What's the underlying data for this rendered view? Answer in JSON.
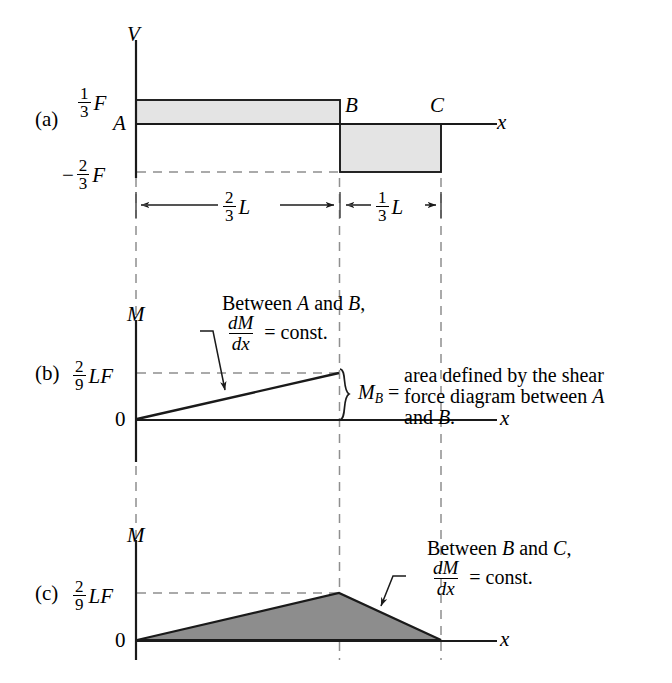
{
  "figure": {
    "colors": {
      "line": "#1a1a1a",
      "dashed": "#8a8a8a",
      "shear_fill_light": "#e2e2e2",
      "moment_fill_dark": "#8c8c8c",
      "background": "#ffffff"
    },
    "panels": [
      {
        "id": "a",
        "tag": "(a)",
        "axis_vertical": "V",
        "axis_horizontal": "x",
        "value_labels": [
          {
            "name": "positive-shear",
            "numerator": "1",
            "denominator": "3",
            "unit": "F",
            "sign": ""
          },
          {
            "name": "point-a",
            "text": "A"
          },
          {
            "name": "negative-shear",
            "numerator": "2",
            "denominator": "3",
            "unit": "F",
            "sign": "−"
          }
        ],
        "point_labels": [
          {
            "name": "point-b",
            "text": "B"
          },
          {
            "name": "point-c",
            "text": "C"
          }
        ],
        "dimensions": [
          {
            "name": "dimension-ab",
            "numerator": "2",
            "denominator": "3",
            "unit": "L"
          },
          {
            "name": "dimension-bc",
            "numerator": "1",
            "denominator": "3",
            "unit": "L"
          }
        ]
      },
      {
        "id": "b",
        "tag": "(b)",
        "axis_vertical": "M",
        "axis_horizontal": "x",
        "value_labels": [
          {
            "name": "peak-moment",
            "numerator": "2",
            "denominator": "9",
            "unit": "LF"
          },
          {
            "name": "zero-origin",
            "text": "0"
          }
        ],
        "annotations": [
          {
            "name": "slope-note-ab",
            "line1": "Between A and B,",
            "fraction_num": "dM",
            "fraction_den": "dx",
            "equals": "= const."
          },
          {
            "name": "mb-note",
            "symbol": "M",
            "subscript": "B",
            "equals": "=",
            "line1": "area defined by the shear",
            "line2": "force diagram between A",
            "line3": "and B."
          }
        ]
      },
      {
        "id": "c",
        "tag": "(c)",
        "axis_vertical": "M",
        "axis_horizontal": "x",
        "value_labels": [
          {
            "name": "peak-moment",
            "numerator": "2",
            "denominator": "9",
            "unit": "LF"
          },
          {
            "name": "zero-origin",
            "text": "0"
          }
        ],
        "annotations": [
          {
            "name": "slope-note-bc",
            "line1": "Between B and C,",
            "fraction_num": "dM",
            "fraction_den": "dx",
            "equals": "= const."
          }
        ]
      }
    ]
  },
  "chart_data": {
    "type": "line",
    "xlabel": "x",
    "subplots": [
      {
        "id": "a",
        "ylabel": "V",
        "description": "Shear force diagram: constant +F/3 from A to B, constant -2F/3 from B to C",
        "x_points": [
          0,
          0.6667,
          0.6667,
          1.0
        ],
        "y_points": [
          0.3333,
          0.3333,
          -0.6667,
          -0.6667
        ],
        "y_units": "F",
        "x_units": "L",
        "ytick_values": [
          0.3333,
          0,
          -0.6667
        ],
        "ytick_labels": [
          "1/3 F",
          "A",
          "-2/3 F"
        ],
        "xtick_values": [
          0.6667,
          1.0
        ],
        "xtick_labels": [
          "B",
          "C"
        ],
        "segments": [
          {
            "from": "A",
            "to": "B",
            "length": "2/3 L",
            "value": "1/3 F"
          },
          {
            "from": "B",
            "to": "C",
            "length": "1/3 L",
            "value": "-2/3 F"
          }
        ]
      },
      {
        "id": "b",
        "ylabel": "M",
        "description": "Bending moment diagram A to B only: linear rise from 0 to 2/9 LF",
        "x_points": [
          0,
          0.6667
        ],
        "y_points": [
          0,
          0.2222
        ],
        "y_units": "LF",
        "ytick_values": [
          0.2222,
          0
        ],
        "ytick_labels": [
          "2/9 LF",
          "0"
        ]
      },
      {
        "id": "c",
        "ylabel": "M",
        "description": "Full bending moment diagram: linear rise 0 to 2/9 LF at B, then linear fall to 0 at C",
        "x_points": [
          0,
          0.6667,
          1.0
        ],
        "y_points": [
          0,
          0.2222,
          0
        ],
        "y_units": "LF",
        "ytick_values": [
          0.2222,
          0
        ],
        "ytick_labels": [
          "2/9 LF",
          "0"
        ]
      }
    ]
  }
}
